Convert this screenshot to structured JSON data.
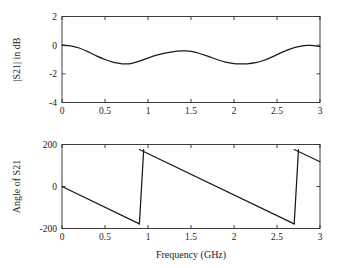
{
  "chart_data": [
    {
      "type": "line",
      "title": "",
      "panel": "magnitude",
      "xlabel": "",
      "ylabel": "|S21| in dB",
      "xlim": [
        0,
        3
      ],
      "ylim": [
        -4,
        2
      ],
      "xticks": [
        0,
        0.5,
        1,
        1.5,
        2,
        2.5,
        3
      ],
      "xticklabels": [
        "0",
        "0.5",
        "1",
        "1.5",
        "2",
        "2.5",
        "3"
      ],
      "yticks": [
        2,
        0,
        -2,
        -4
      ],
      "yticklabels": [
        "2",
        "0",
        "-2",
        "-4"
      ],
      "grid": false,
      "legend": null,
      "series": [
        {
          "name": "|S21|",
          "x": [
            0.0,
            0.1,
            0.2,
            0.3,
            0.4,
            0.5,
            0.6,
            0.7,
            0.72,
            0.8,
            0.9,
            1.0,
            1.1,
            1.2,
            1.3,
            1.4,
            1.43,
            1.5,
            1.6,
            1.7,
            1.8,
            1.9,
            2.0,
            2.1,
            2.15,
            2.25,
            2.35,
            2.45,
            2.55,
            2.65,
            2.75,
            2.85,
            2.9,
            2.95,
            3.0
          ],
          "values": [
            0.0,
            -0.05,
            -0.2,
            -0.45,
            -0.75,
            -1.0,
            -1.2,
            -1.3,
            -1.31,
            -1.28,
            -1.12,
            -0.9,
            -0.7,
            -0.55,
            -0.45,
            -0.4,
            -0.4,
            -0.44,
            -0.58,
            -0.78,
            -1.0,
            -1.18,
            -1.28,
            -1.3,
            -1.3,
            -1.22,
            -1.05,
            -0.8,
            -0.52,
            -0.27,
            -0.1,
            -0.02,
            -0.02,
            -0.05,
            -0.1
          ]
        }
      ]
    },
    {
      "type": "line",
      "title": "",
      "panel": "phase",
      "xlabel": "Frequency (GHz)",
      "ylabel": "Angle of S21",
      "xlim": [
        0,
        3
      ],
      "ylim": [
        -200,
        200
      ],
      "xticks": [
        0,
        0.5,
        1,
        1.5,
        2,
        2.5,
        3
      ],
      "xticklabels": [
        "0",
        "0.5",
        "1",
        "1.5",
        "2",
        "2.5",
        "3"
      ],
      "yticks": [
        200,
        0,
        -200
      ],
      "yticklabels": [
        "200",
        "0",
        "-200"
      ],
      "grid": false,
      "legend": null,
      "wrap_points": [
        0.9,
        2.7
      ],
      "series": [
        {
          "name": "Angle of S21 segment 1",
          "x": [
            0.0,
            0.9
          ],
          "values": [
            0,
            -178
          ]
        },
        {
          "name": "Angle of S21 segment 2",
          "x": [
            0.9,
            2.7
          ],
          "values": [
            176,
            -178
          ]
        },
        {
          "name": "Angle of S21 segment 3",
          "x": [
            2.7,
            3.0
          ],
          "values": [
            176,
            118
          ]
        }
      ]
    }
  ]
}
